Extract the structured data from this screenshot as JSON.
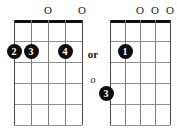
{
  "diagrams": [
    {
      "name": "left-chord-diagram",
      "strings": 5,
      "frets": 5,
      "open_markers": [
        {
          "string": 3,
          "symbol": "O"
        },
        {
          "string": 5,
          "symbol": "O"
        }
      ],
      "finger_dots": [
        {
          "label": "2",
          "string": 1,
          "fret": 2
        },
        {
          "label": "3",
          "string": 2,
          "fret": 2
        },
        {
          "label": "4",
          "string": 4,
          "fret": 2
        }
      ]
    },
    {
      "name": "right-chord-diagram",
      "strings": 5,
      "frets": 5,
      "open_markers": [
        {
          "string": 3,
          "symbol": "O"
        },
        {
          "string": 4,
          "symbol": "O"
        },
        {
          "string": 5,
          "symbol": "O"
        }
      ],
      "finger_dots": [
        {
          "label": "1",
          "string": 2,
          "fret": 2
        },
        {
          "label": "3",
          "string": 1,
          "fret": 4
        }
      ]
    }
  ],
  "connector": {
    "or_label": "or",
    "alt_label": "o"
  },
  "colors": {
    "nut": "#111111",
    "fret": "#8e8e8e",
    "string": "#7d7d7d",
    "string_edge": "#4a4a4a",
    "dot_fill": "#0d0d0d",
    "dot_text": "#ffffff",
    "text": "#1a1a1a",
    "background": "#ffffff"
  }
}
